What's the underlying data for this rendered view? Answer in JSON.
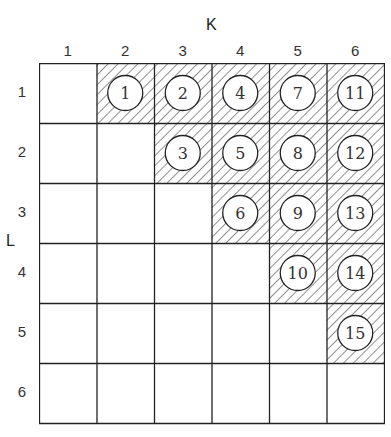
{
  "diagram": {
    "col_axis_title": "K",
    "row_axis_title": "L",
    "col_labels": [
      "1",
      "2",
      "3",
      "4",
      "5",
      "6"
    ],
    "row_labels": [
      "1",
      "2",
      "3",
      "4",
      "5",
      "6"
    ],
    "colors": {
      "line": "#222222",
      "hatch": "#333333",
      "background": "#ffffff"
    },
    "cells": [
      {
        "row": 1,
        "col": 2,
        "number": "1"
      },
      {
        "row": 1,
        "col": 3,
        "number": "2"
      },
      {
        "row": 1,
        "col": 4,
        "number": "4"
      },
      {
        "row": 1,
        "col": 5,
        "number": "7"
      },
      {
        "row": 1,
        "col": 6,
        "number": "11"
      },
      {
        "row": 2,
        "col": 3,
        "number": "3"
      },
      {
        "row": 2,
        "col": 4,
        "number": "5"
      },
      {
        "row": 2,
        "col": 5,
        "number": "8"
      },
      {
        "row": 2,
        "col": 6,
        "number": "12"
      },
      {
        "row": 3,
        "col": 4,
        "number": "6"
      },
      {
        "row": 3,
        "col": 5,
        "number": "9"
      },
      {
        "row": 3,
        "col": 6,
        "number": "13"
      },
      {
        "row": 4,
        "col": 5,
        "number": "10"
      },
      {
        "row": 4,
        "col": 6,
        "number": "14"
      },
      {
        "row": 5,
        "col": 6,
        "number": "15"
      }
    ]
  }
}
